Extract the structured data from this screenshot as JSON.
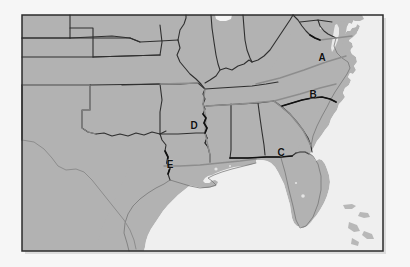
{
  "figure": {
    "kind": "reference-map",
    "frame": {
      "x": 22,
      "y": 15,
      "width": 361,
      "height": 236,
      "border_color": "#2b2b2b",
      "border_width": 1.5
    },
    "colors": {
      "page_background": "#f6f6f6",
      "land": "#b2b2b2",
      "land_shadow": "#a8a8a8",
      "water": "#eeeeee",
      "ocean": "#efefef",
      "state_border": "#2f2f2f",
      "highlight_border": "#8d8d8d",
      "label_text": "#111111"
    }
  },
  "labels": [
    {
      "id": "A",
      "text": "A",
      "x": 322,
      "y": 61,
      "region_hint": "Virginia interior"
    },
    {
      "id": "B",
      "text": "B",
      "x": 313,
      "y": 98,
      "region_hint": "North Carolina / South Carolina border"
    },
    {
      "id": "C",
      "text": "C",
      "x": 281,
      "y": 156,
      "region_hint": "Alabama / Florida panhandle border"
    },
    {
      "id": "D",
      "text": "D",
      "x": 194,
      "y": 129,
      "region_hint": "Arkansas / Mississippi river border"
    },
    {
      "id": "E",
      "text": "E",
      "x": 170,
      "y": 168,
      "region_hint": "Texas / Louisiana border"
    }
  ],
  "legend": {
    "present": false,
    "items": []
  },
  "annotations": {
    "axis_labels": [],
    "caption": ""
  }
}
